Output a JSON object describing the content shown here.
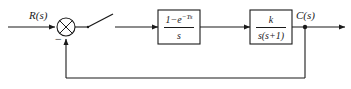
{
  "diagram": {
    "type": "control-block-diagram",
    "stroke_color": "#1a1a1a",
    "background_color": "#ffffff"
  },
  "signals": {
    "input_label": "R(s)",
    "output_label": "C(s)",
    "feedback_sign": "−"
  },
  "blocks": [
    {
      "name": "zero-order-hold",
      "numerator": "1−e",
      "numerator_exponent": "−Ts",
      "denominator": "s"
    },
    {
      "name": "plant",
      "numerator": "k",
      "numerator_exponent": "",
      "denominator": "s(s+1)"
    }
  ],
  "elements": {
    "summing_junction": "summing-junction",
    "sampler": "sampler-switch",
    "takeoff": "takeoff-node"
  }
}
